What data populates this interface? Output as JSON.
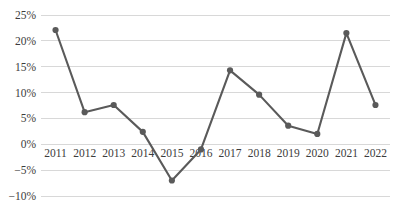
{
  "chart_data": {
    "type": "line",
    "title": "",
    "subtitle": "",
    "xlabel": "",
    "ylabel": "",
    "categories": [
      "2011",
      "2012",
      "2013",
      "2014",
      "2015",
      "2016",
      "2017",
      "2018",
      "2019",
      "2020",
      "2021",
      "2022"
    ],
    "values": [
      22.1,
      6.2,
      7.6,
      2.4,
      -7.0,
      -1.0,
      14.3,
      9.6,
      3.6,
      2.0,
      21.5,
      7.6
    ],
    "series": [
      {
        "name": "",
        "values": [
          22.1,
          6.2,
          7.6,
          2.4,
          -7.0,
          -1.0,
          14.3,
          9.6,
          3.6,
          2.0,
          21.5,
          7.6
        ]
      }
    ],
    "ylim": [
      -10,
      25
    ],
    "ytick_values": [
      25,
      20,
      15,
      10,
      5,
      0,
      -5,
      -10
    ],
    "ytick_labels": [
      "25%",
      "20%",
      "15%",
      "10%",
      "5%",
      "0%",
      "−5%",
      "−10%"
    ],
    "xtick_labels": [
      "2011",
      "2012",
      "2013",
      "2014",
      "2015",
      "2016",
      "2017",
      "2018",
      "2019",
      "2020",
      "2021",
      "2022"
    ],
    "grid": true,
    "grid_axis": "y",
    "legend": false,
    "legend_position": "none",
    "annotations": [],
    "markers": true,
    "unit": "%",
    "colors": {
      "line": "#5a5a5a",
      "marker": "#5a5a5a",
      "grid": "#d4d4d4",
      "tick_text": "#3c3c3c",
      "background": "#ffffff"
    }
  }
}
